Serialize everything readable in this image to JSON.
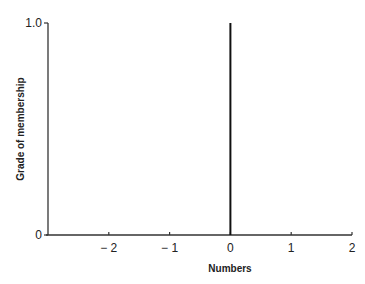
{
  "chart_data": {
    "type": "line",
    "title": "",
    "xlabel": "Numbers",
    "ylabel": "Grade of membership",
    "xlim": [
      -3,
      2
    ],
    "ylim": [
      0,
      1.0
    ],
    "x_ticks": [
      -2,
      -1,
      0,
      1,
      2
    ],
    "x_tick_labels": [
      "− 2",
      "− 1",
      "0",
      "1",
      "2"
    ],
    "y_ticks": [
      0,
      1.0
    ],
    "y_tick_labels": [
      "0",
      "1.0"
    ],
    "grid": false,
    "legend": null,
    "series": [
      {
        "name": "crisp singleton at 0",
        "x": [
          0,
          0
        ],
        "y": [
          0,
          1.0
        ]
      }
    ],
    "colors": {
      "axis": "#333333",
      "series": "#111111"
    }
  }
}
